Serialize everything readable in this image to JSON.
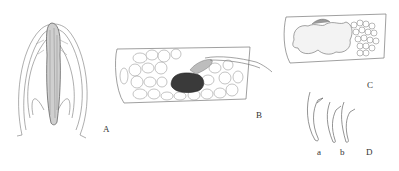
{
  "figure": {
    "panels": [
      {
        "id": "A",
        "label": "A",
        "description": "whole organism, anterior view line drawing"
      },
      {
        "id": "B",
        "label": "B",
        "description": "body segment with cells and dark gonad"
      },
      {
        "id": "C",
        "label": "C",
        "description": "body segment with lobed structures and granular mass"
      },
      {
        "id": "D",
        "label": "D",
        "description": "hooks / setae",
        "subpanels": [
          {
            "id": "a",
            "label": "a"
          },
          {
            "id": "b",
            "label": "b"
          }
        ]
      }
    ]
  }
}
